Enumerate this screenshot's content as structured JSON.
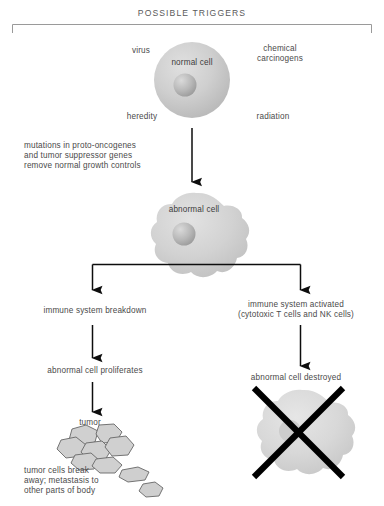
{
  "diagram": {
    "title": "POSSIBLE TRIGGERS",
    "triggers": {
      "virus": "virus",
      "chemical_carcinogens": "chemical\ncarcinogens",
      "heredity": "heredity",
      "radiation": "radiation"
    },
    "nodes": {
      "normal_cell": "normal cell",
      "mutations": "mutations in proto-oncogenes\nand tumor suppressor genes\nremove normal growth controls",
      "abnormal_cell": "abnormal cell",
      "immune_breakdown": "immune system breakdown",
      "immune_activated": "immune system activated\n(cytotoxic T cells and NK cells)",
      "cell_proliferates": "abnormal cell proliferates",
      "cell_destroyed": "abnormal cell destroyed",
      "tumor": "tumor",
      "metastasis": "tumor cells break\naway; metastasis to\nother parts of body"
    },
    "colors": {
      "background": "#ffffff",
      "text": "#4a4a4a",
      "arrow": "#0d0d0d",
      "bracket": "#8e8e8e",
      "cell_fill": "#c9c9c9",
      "cell_fill_light": "#d6d6d6",
      "nucleus": "#b2b2b2",
      "tumor_cell_fill": "#cfcfcf",
      "tumor_cell_stroke": "#6a6a6a",
      "cross": "#000000"
    }
  }
}
